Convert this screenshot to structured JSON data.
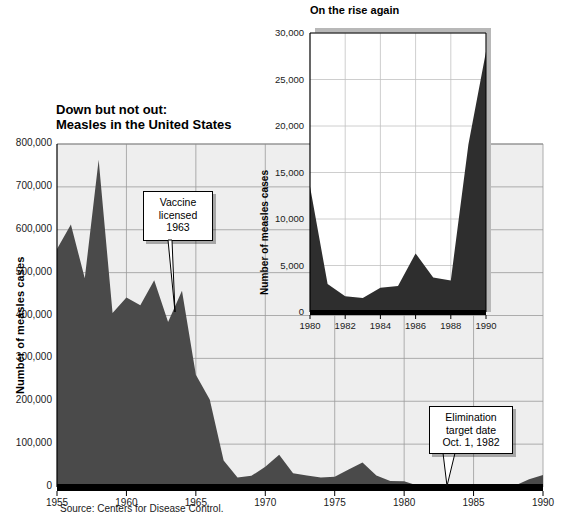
{
  "figure": {
    "source_note": "Source: Centers for Disease Control.",
    "background_color": "#ffffff",
    "area_fill_color": "#4a4a4a",
    "plot_bg_color": "#eeeeee",
    "grid_color": "#9a9a9a"
  },
  "main": {
    "title": "Down but not out:\nMeasles in the United States",
    "ylabel": "Number of measles cases",
    "ytick_labels": [
      "0",
      "100,000",
      "200,000",
      "300,000",
      "400,000",
      "500,000",
      "600,000",
      "700,000",
      "800,000"
    ],
    "xtick_labels": [
      "1955",
      "1960",
      "1965",
      "1970",
      "1975",
      "1980",
      "1985",
      "1990"
    ],
    "callout_vaccine": "Vaccine\nlicensed\n1963",
    "callout_elimination": "Elimination\ntarget date\nOct. 1, 1982"
  },
  "inset": {
    "title": "On the rise again",
    "ylabel": "Number of measles cases",
    "ytick_labels": [
      "0",
      "5,000",
      "10,000",
      "15,000",
      "20,000",
      "25,000",
      "30,000"
    ],
    "xtick_labels": [
      "1980",
      "1982",
      "1984",
      "1986",
      "1988",
      "1990"
    ]
  },
  "chart_data": [
    {
      "type": "area",
      "id": "main-measles-area",
      "title": "Down but not out: Measles in the United States",
      "xlabel": "",
      "ylabel": "Number of measles cases",
      "xlim": [
        1955,
        1990
      ],
      "ylim": [
        0,
        800000
      ],
      "xticks": [
        1955,
        1960,
        1965,
        1970,
        1975,
        1980,
        1985,
        1990
      ],
      "yticks": [
        0,
        100000,
        200000,
        300000,
        400000,
        500000,
        600000,
        700000,
        800000
      ],
      "grid": true,
      "legend": "none",
      "x": [
        1955,
        1956,
        1957,
        1958,
        1959,
        1960,
        1961,
        1962,
        1963,
        1964,
        1965,
        1966,
        1967,
        1968,
        1969,
        1970,
        1971,
        1972,
        1973,
        1974,
        1975,
        1976,
        1977,
        1978,
        1979,
        1980,
        1981,
        1982,
        1983,
        1984,
        1985,
        1986,
        1987,
        1988,
        1989,
        1990
      ],
      "values": [
        555000,
        612000,
        487000,
        763000,
        406000,
        442000,
        424000,
        482000,
        385000,
        458000,
        262000,
        204000,
        62000,
        22000,
        26000,
        47000,
        75000,
        32000,
        27000,
        22000,
        24000,
        41000,
        57000,
        27000,
        14000,
        13500,
        3000,
        1700,
        1500,
        2600,
        2800,
        6300,
        3700,
        3400,
        18000,
        28000
      ],
      "annotations": [
        {
          "text": "Vaccine licensed 1963",
          "points_to_x": 1963
        },
        {
          "text": "Elimination target date Oct. 1, 1982",
          "points_to_x": 1983
        }
      ],
      "source": "Source: Centers for Disease Control."
    },
    {
      "type": "area",
      "id": "inset-on-the-rise-again",
      "title": "On the rise again",
      "xlabel": "",
      "ylabel": "Number of measles cases",
      "xlim": [
        1980,
        1990
      ],
      "ylim": [
        0,
        30000
      ],
      "xticks": [
        1980,
        1982,
        1984,
        1986,
        1988,
        1990
      ],
      "yticks": [
        0,
        5000,
        10000,
        15000,
        20000,
        25000,
        30000
      ],
      "grid": true,
      "legend": "none",
      "x": [
        1980,
        1981,
        1982,
        1983,
        1984,
        1985,
        1986,
        1987,
        1988,
        1989,
        1990
      ],
      "values": [
        13500,
        3000,
        1700,
        1500,
        2600,
        2800,
        6300,
        3700,
        3400,
        18000,
        28000
      ]
    }
  ]
}
